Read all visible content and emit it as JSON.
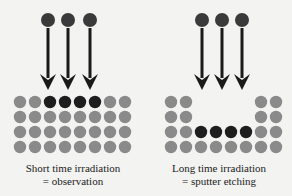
{
  "colors": {
    "background": "#f3f3f1",
    "ion": "#3a3a3a",
    "arrow": "#1a1a1a",
    "surface_atom": "#8a8a8a",
    "marked_atom": "#1e1e1e"
  },
  "left_panel": {
    "caption_line1": "Short time irradiation",
    "caption_line2": "= observation",
    "ions": 3,
    "grid": {
      "rows": 4,
      "cols": 8,
      "marked": [
        [
          0,
          2
        ],
        [
          0,
          3
        ],
        [
          0,
          4
        ],
        [
          0,
          5
        ]
      ],
      "missing": []
    }
  },
  "right_panel": {
    "caption_line1": "Long time irradiation",
    "caption_line2": "= sputter etching",
    "ions": 3,
    "grid": {
      "rows": 4,
      "cols": 8,
      "marked": [
        [
          2,
          2
        ],
        [
          2,
          3
        ],
        [
          2,
          4
        ],
        [
          2,
          5
        ]
      ],
      "missing": [
        [
          0,
          2
        ],
        [
          0,
          3
        ],
        [
          0,
          4
        ],
        [
          0,
          5
        ],
        [
          1,
          2
        ],
        [
          1,
          3
        ],
        [
          1,
          4
        ],
        [
          1,
          5
        ]
      ]
    }
  }
}
